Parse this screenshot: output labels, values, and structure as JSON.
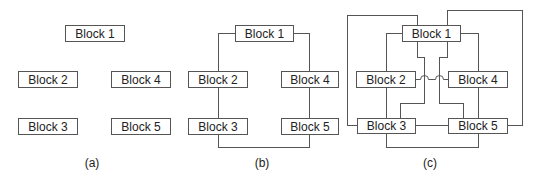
{
  "figure": {
    "panels": [
      {
        "id": "a",
        "caption": "(a)",
        "blocks": [
          "Block 1",
          "Block 2",
          "Block 3",
          "Block 4",
          "Block 5"
        ],
        "connections": []
      },
      {
        "id": "b",
        "caption": "(b)",
        "blocks": [
          "Block 1",
          "Block 2",
          "Block 3",
          "Block 4",
          "Block 5"
        ],
        "connections": [
          [
            "Block 1",
            "Block 2"
          ],
          [
            "Block 2",
            "Block 3"
          ],
          [
            "Block 3",
            "Block 5"
          ],
          [
            "Block 5",
            "Block 4"
          ],
          [
            "Block 4",
            "Block 1"
          ]
        ]
      },
      {
        "id": "c",
        "caption": "(c)",
        "blocks": [
          "Block 1",
          "Block 2",
          "Block 3",
          "Block 4",
          "Block 5"
        ],
        "connections": [
          [
            "Block 1",
            "Block 2"
          ],
          [
            "Block 2",
            "Block 3"
          ],
          [
            "Block 3",
            "Block 5"
          ],
          [
            "Block 5",
            "Block 4"
          ],
          [
            "Block 4",
            "Block 1"
          ],
          [
            "Block 1",
            "Block 3"
          ],
          [
            "Block 1",
            "Block 5"
          ],
          [
            "Block 2",
            "Block 4"
          ],
          [
            "Block 3",
            "Block 5"
          ]
        ],
        "crossing_style": "hop-over"
      }
    ],
    "line_color": "#555555",
    "text_color": "#222222"
  }
}
